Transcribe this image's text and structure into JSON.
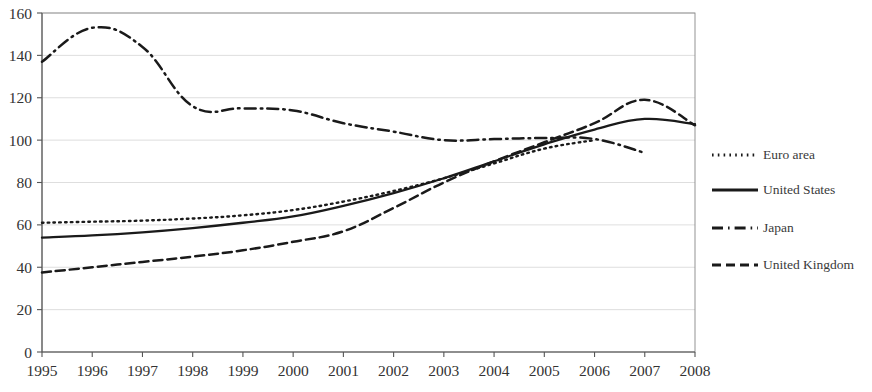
{
  "chart_data": {
    "type": "line",
    "title": "",
    "subtitle": "",
    "xlabel": "",
    "ylabel": "",
    "grid": true,
    "legend_position": "right",
    "x": [
      1995,
      1996,
      1997,
      1998,
      1999,
      2000,
      2001,
      2002,
      2003,
      2004,
      2005,
      2006,
      2007,
      2008
    ],
    "categories": [
      "1995",
      "1996",
      "1997",
      "1998",
      "1999",
      "2000",
      "2001",
      "2002",
      "2003",
      "2004",
      "2005",
      "2006",
      "2007",
      "2008"
    ],
    "xlim": [
      1995,
      2008
    ],
    "ylim": [
      0,
      160
    ],
    "yticks": [
      0,
      20,
      40,
      60,
      80,
      100,
      120,
      140,
      160
    ],
    "ytick_labels": [
      "0",
      "20",
      "40",
      "60",
      "80",
      "100",
      "120",
      "140",
      "160"
    ],
    "series": [
      {
        "name": "Euro area",
        "style": "dotted",
        "color": "#1a1a1a",
        "values": [
          61,
          61.5,
          62,
          63,
          64.5,
          67,
          71,
          76,
          82,
          89,
          96,
          100,
          null,
          null
        ]
      },
      {
        "name": "United States",
        "style": "solid",
        "color": "#1a1a1a",
        "values": [
          54,
          55,
          56.5,
          58.5,
          61,
          64,
          69,
          75,
          82,
          90,
          98,
          105,
          110,
          107.5
        ]
      },
      {
        "name": "Japan",
        "style": "dash-dot",
        "color": "#1a1a1a",
        "values": [
          137,
          153,
          144,
          116,
          115,
          114,
          108,
          104,
          100,
          100.5,
          101,
          100.5,
          94,
          null
        ]
      },
      {
        "name": "United Kingdom",
        "style": "dashed",
        "color": "#1a1a1a",
        "values": [
          37.5,
          40,
          42.5,
          45,
          48,
          52,
          57,
          68,
          80,
          90,
          99,
          108,
          119,
          107
        ]
      }
    ]
  },
  "legend": {
    "items": [
      {
        "label": "Euro area",
        "style": "dotted"
      },
      {
        "label": "United States",
        "style": "solid"
      },
      {
        "label": "Japan",
        "style": "dash-dot"
      },
      {
        "label": "United Kingdom",
        "style": "dashed"
      }
    ]
  }
}
